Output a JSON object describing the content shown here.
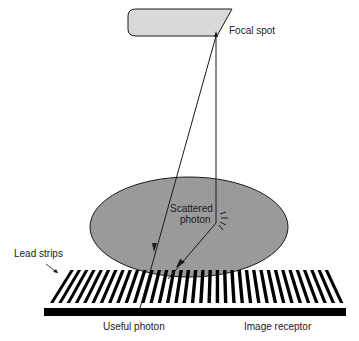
{
  "diagram": {
    "labels": {
      "focal_spot": "Focal spot",
      "scattered_photon_line1": "Scattered",
      "scattered_photon_line2": "photon",
      "lead_strips": "Lead strips",
      "useful_photon": "Useful photon",
      "image_receptor": "Image receptor"
    },
    "colors": {
      "tube_fill": "#d9d9d9",
      "patient_fill": "#9a9a9a",
      "strip": "#000000",
      "line": "#1a1a1a"
    },
    "grid_strip_count": 36
  }
}
